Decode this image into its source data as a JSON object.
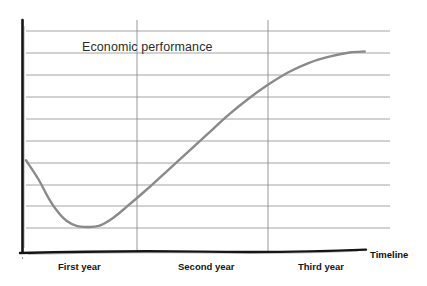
{
  "chart_data": {
    "type": "line",
    "title": "Economic performance",
    "xlabel": "Timeline",
    "ylabel": "",
    "categories": [
      "First year",
      "Second year",
      "Third year"
    ],
    "series": [
      {
        "name": "Economic performance",
        "color": "#8a8a8a",
        "points": [
          {
            "x": 0.0,
            "y": 3.3
          },
          {
            "x": 0.12,
            "y": 2.4
          },
          {
            "x": 0.23,
            "y": 1.4
          },
          {
            "x": 0.32,
            "y": 0.75
          },
          {
            "x": 0.4,
            "y": 0.35
          },
          {
            "x": 0.5,
            "y": 0.1
          },
          {
            "x": 0.6,
            "y": 0.05
          },
          {
            "x": 0.72,
            "y": 0.1
          },
          {
            "x": 0.85,
            "y": 0.45
          },
          {
            "x": 1.0,
            "y": 1.05
          },
          {
            "x": 1.2,
            "y": 1.9
          },
          {
            "x": 1.4,
            "y": 2.8
          },
          {
            "x": 1.6,
            "y": 3.7
          },
          {
            "x": 1.8,
            "y": 4.6
          },
          {
            "x": 2.0,
            "y": 5.5
          },
          {
            "x": 2.2,
            "y": 6.3
          },
          {
            "x": 2.4,
            "y": 7.0
          },
          {
            "x": 2.6,
            "y": 7.6
          },
          {
            "x": 2.8,
            "y": 8.05
          },
          {
            "x": 3.0,
            "y": 8.35
          },
          {
            "x": 3.2,
            "y": 8.55
          },
          {
            "x": 3.35,
            "y": 8.6
          }
        ]
      }
    ],
    "gridlines_y_count": 10,
    "grid": true,
    "vertical_dividers": [
      "First year end",
      "Second year end"
    ],
    "xlim": [
      0,
      3.6
    ],
    "ylim": [
      0,
      9.6
    ],
    "legend": "none",
    "axis_color": "#111111",
    "grid_color": "#9a9a9a"
  },
  "chart": {
    "title": "Economic performance",
    "x_axis_label": "Timeline",
    "year_labels": [
      "First year",
      "Second year",
      "Third year"
    ],
    "curve_color": "#8a8a8a"
  }
}
